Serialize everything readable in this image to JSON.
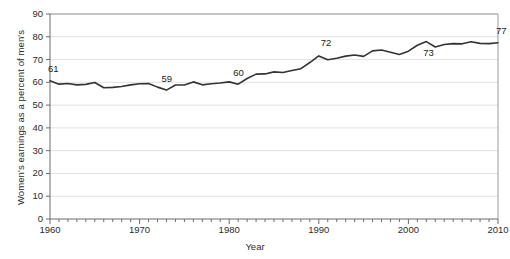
{
  "chart_data": {
    "type": "line",
    "title": "",
    "subtitle": "",
    "xlabel": "Year",
    "ylabel": "Women's earnings as a percent of men's",
    "xlim": [
      1960,
      2010
    ],
    "ylim": [
      0,
      90
    ],
    "grid": true,
    "legend": "none",
    "line_color": "#333333",
    "grid_color": "#e2e2e2",
    "axis_color": "#8c8c8c",
    "y_ticks": [
      0,
      10,
      20,
      30,
      40,
      50,
      60,
      70,
      80,
      90
    ],
    "y_tick_labels": [
      "0",
      "10",
      "20",
      "30",
      "40",
      "50",
      "60",
      "70",
      "80",
      "90"
    ],
    "x_ticks": [
      1960,
      1970,
      1980,
      1990,
      2000,
      2010
    ],
    "x_tick_labels": [
      "1960",
      "1970",
      "1980",
      "1990",
      "2000",
      "2010"
    ],
    "x_minor_tick_step": 1,
    "series": [
      {
        "name": "Women's earnings as a percent of men's",
        "x": [
          1960,
          1961,
          1962,
          1963,
          1964,
          1965,
          1966,
          1967,
          1968,
          1969,
          1970,
          1971,
          1972,
          1973,
          1974,
          1975,
          1976,
          1977,
          1978,
          1979,
          1980,
          1981,
          1982,
          1983,
          1984,
          1985,
          1986,
          1987,
          1988,
          1989,
          1990,
          1991,
          1992,
          1993,
          1994,
          1995,
          1996,
          1997,
          1998,
          1999,
          2000,
          2001,
          2002,
          2003,
          2004,
          2005,
          2006,
          2007,
          2008,
          2009,
          2010
        ],
        "values": [
          60.7,
          59.2,
          59.5,
          58.9,
          59.1,
          59.9,
          57.6,
          57.8,
          58.2,
          58.9,
          59.4,
          59.5,
          57.9,
          56.6,
          58.8,
          58.8,
          60.2,
          58.9,
          59.4,
          59.7,
          60.2,
          59.2,
          61.7,
          63.6,
          63.7,
          64.6,
          64.3,
          65.2,
          66.0,
          68.7,
          71.6,
          69.9,
          70.6,
          71.5,
          72.0,
          71.4,
          73.8,
          74.2,
          73.2,
          72.2,
          73.7,
          76.3,
          77.9,
          75.5,
          76.6,
          77.0,
          76.9,
          77.8,
          77.1,
          77.0,
          77.4
        ]
      }
    ],
    "point_labels": [
      {
        "label": "61",
        "year": 1960,
        "value": 60.7
      },
      {
        "label": "59",
        "year": 1973,
        "value": 56.6
      },
      {
        "label": "60",
        "year": 1981,
        "value": 59.2
      },
      {
        "label": "72",
        "year": 1990,
        "value": 71.6
      },
      {
        "label": "73",
        "year": 2002,
        "value": 77.9
      },
      {
        "label": "77",
        "year": 2010,
        "value": 77.4
      }
    ]
  },
  "labels": {
    "y_axis_title": "Women's earnings as a percent of men's",
    "x_axis_title": "Year"
  }
}
